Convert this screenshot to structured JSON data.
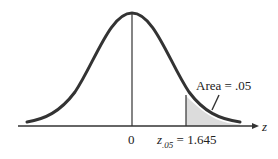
{
  "diagram": {
    "title": "",
    "type": "standard normal distribution, right-tail area",
    "axis_label": "z",
    "center_tick": "0",
    "critical_value": {
      "symbol": "z",
      "subscript": ".05",
      "equals": "= 1.645",
      "value": 1.645
    },
    "area_label": "Area = .05",
    "area_value": 0.05,
    "colors": {
      "curve": "#333333",
      "shade": "#dcdcdc",
      "axis": "#333333"
    }
  }
}
